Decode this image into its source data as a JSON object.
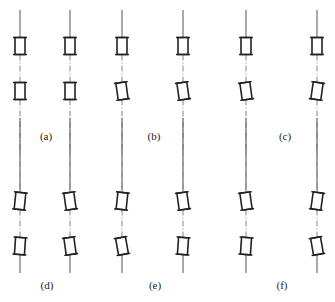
{
  "figure": {
    "panels": [
      {
        "id": "a",
        "label": "(a)",
        "label_x": 46,
        "label_y": 130,
        "lines": [
          20,
          70
        ],
        "row": "top",
        "upper_tilt": [
          0,
          0
        ],
        "lower_tilt": [
          0,
          0
        ]
      },
      {
        "id": "b",
        "label": "(b)",
        "label_x": 154,
        "label_y": 130,
        "lines": [
          122
        ],
        "row": "top",
        "upper_tilt": [
          0
        ],
        "lower_tilt": [
          -8
        ]
      },
      {
        "id": "c",
        "label": "(c)",
        "label_x": 285,
        "label_y": 130,
        "lines": [
          183,
          246,
          317
        ],
        "row": "top",
        "upper_tilt": [
          0,
          0,
          0
        ],
        "lower_tilt": [
          -8,
          -8,
          8
        ]
      },
      {
        "id": "d",
        "label": "(d)",
        "label_x": 47,
        "label_y": 279,
        "lines": [
          20,
          70
        ],
        "row": "bottom",
        "upper_tilt": [
          6,
          -8
        ],
        "lower_tilt": [
          4,
          -8
        ]
      },
      {
        "id": "e",
        "label": "(e)",
        "label_x": 155,
        "label_y": 279,
        "lines": [
          122
        ],
        "row": "bottom",
        "upper_tilt": [
          6
        ],
        "lower_tilt": [
          -10
        ]
      },
      {
        "id": "f",
        "label": "(f)",
        "label_x": 282,
        "label_y": 279,
        "lines": [
          183,
          246,
          317
        ],
        "row": "bottom",
        "upper_tilt": [
          -8,
          -8,
          8
        ],
        "lower_tilt": [
          4,
          4,
          -10
        ]
      }
    ],
    "rows": {
      "top": {
        "line_top": 10,
        "line_bottom": 150,
        "upper_box_y": 46,
        "lower_box_y": 91
      },
      "bottom": {
        "line_top": 150,
        "line_bottom": 273,
        "upper_box_y": 201,
        "lower_box_y": 246
      }
    },
    "box": {
      "width": 10,
      "height": 17
    }
  }
}
